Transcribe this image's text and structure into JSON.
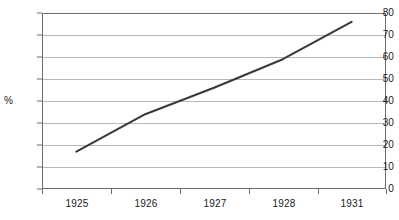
{
  "chart_data": {
    "type": "line",
    "title": "",
    "subtitle": "",
    "xlabel": "",
    "ylabel": "%",
    "categories": [
      "1925",
      "1926",
      "1927",
      "1928",
      "1931"
    ],
    "series": [
      {
        "name": "",
        "values": [
          17,
          34,
          46,
          59,
          76
        ],
        "color": "#3a3a3a"
      }
    ],
    "ylim": [
      0,
      80
    ],
    "y_ticks": [
      0,
      10,
      20,
      30,
      40,
      50,
      60,
      70,
      80
    ],
    "y_ticklabels": [
      "0",
      "10",
      "20",
      "30",
      "40",
      "50",
      "60",
      "70",
      "80"
    ],
    "grid": "horizontal",
    "legend": "none",
    "annotations": [],
    "axis_color": "#6e6e6e",
    "gridline_color": "#b9b9b9",
    "background": "#ffffff"
  }
}
